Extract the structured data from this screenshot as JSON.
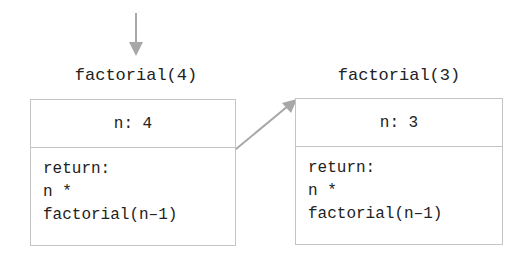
{
  "frames": [
    {
      "title": "factorial(4)",
      "param": "n: 4",
      "body_lines": [
        "return:",
        "n *",
        "factorial(n–1)"
      ]
    },
    {
      "title": "factorial(3)",
      "param": "n: 3",
      "body_lines": [
        "return:",
        "n *",
        "factorial(n–1)"
      ]
    }
  ],
  "colors": {
    "arrow": "#a8a8a8",
    "border": "#c4c4c4",
    "text": "#222222"
  }
}
